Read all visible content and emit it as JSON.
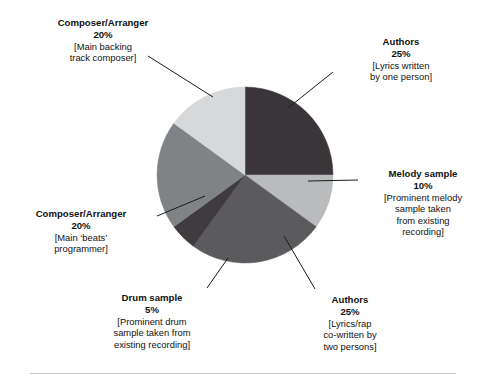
{
  "chart_data": {
    "type": "pie",
    "title": "",
    "subtitle": "",
    "xlabel": "",
    "ylabel": "",
    "legend_position": "callout-labels",
    "grid": false,
    "total": 100,
    "units": "%",
    "start_angle_deg": 0,
    "direction": "clockwise",
    "categories": [
      "Authors",
      "Melody sample",
      "Authors",
      "Drum sample",
      "Composer/Arranger",
      "Composer/Arranger"
    ],
    "values": [
      25,
      10,
      25,
      5,
      20,
      20
    ],
    "colors": [
      "#3a3539",
      "#b9bbbc",
      "#5b5b5d",
      "#403b3f",
      "#808386",
      "#d6d8d9"
    ],
    "slices": [
      {
        "name": "Authors",
        "percent_label": "25%",
        "value": 25,
        "description": "[Lyrics written\nby one person]",
        "color": "#3a3539",
        "start_deg": 0,
        "end_deg": 90
      },
      {
        "name": "Melody sample",
        "percent_label": "10%",
        "value": 10,
        "description": "[Prominent melody\nsample taken\nfrom existing\nrecording]",
        "color": "#b9bbbc",
        "start_deg": 90,
        "end_deg": 126
      },
      {
        "name": "Authors",
        "percent_label": "25%",
        "value": 25,
        "description": "[Lyrics/rap\nco-written by\ntwo persons]",
        "color": "#5b5b5d",
        "start_deg": 126,
        "end_deg": 216
      },
      {
        "name": "Drum sample",
        "percent_label": "5%",
        "value": 5,
        "description": "[Prominent drum\nsample taken from\nexisting recording]",
        "color": "#403b3f",
        "start_deg": 216,
        "end_deg": 234
      },
      {
        "name": "Composer/Arranger",
        "percent_label": "20%",
        "value": 20,
        "description": "[Main ‘beats’\nprogrammer]",
        "color": "#808386",
        "start_deg": 234,
        "end_deg": 306
      },
      {
        "name": "Composer/Arranger",
        "percent_label": "20%",
        "value": 20,
        "description": "[Main backing\ntrack composer]",
        "color": "#d6d8d9",
        "start_deg": 306,
        "end_deg": 360
      }
    ]
  },
  "callouts": {
    "backing": {
      "title": "Composer/Arranger",
      "percent": "20%",
      "description": "[Main backing\ntrack composer]"
    },
    "authors_one": {
      "title": "Authors",
      "percent": "25%",
      "description": "[Lyrics written\nby one person]"
    },
    "melody": {
      "title": "Melody sample",
      "percent": "10%",
      "description": "[Prominent melody\nsample taken\nfrom existing\nrecording]"
    },
    "authors_two": {
      "title": "Authors",
      "percent": "25%",
      "description": "[Lyrics/rap\nco-written by\ntwo persons]"
    },
    "drum": {
      "title": "Drum sample",
      "percent": "5%",
      "description": "[Prominent drum\nsample taken from\nexisting recording]"
    },
    "beats": {
      "title": "Composer/Arranger",
      "percent": "20%",
      "description": "[Main ‘beats’\nprogrammer]"
    }
  }
}
